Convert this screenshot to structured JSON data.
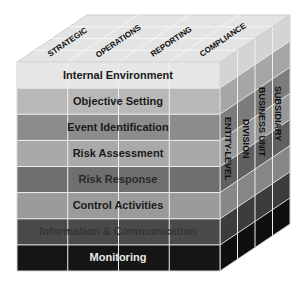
{
  "diagram": {
    "type": "coso-erm-cube",
    "top_face": {
      "objectives": [
        {
          "label": "STRATEGIC"
        },
        {
          "label": "OPERATIONS"
        },
        {
          "label": "REPORTING"
        },
        {
          "label": "COMPLIANCE"
        }
      ]
    },
    "front_face": {
      "components": [
        {
          "label": "Internal Environment",
          "fill": "#e6e6e6",
          "text_color": "#1a1a1a"
        },
        {
          "label": "Objective Setting",
          "fill": "#b8b8b8",
          "text_color": "#1a1a1a"
        },
        {
          "label": "Event Identification",
          "fill": "#8c8c8c",
          "text_color": "#1a1a1a"
        },
        {
          "label": "Risk Assessment",
          "fill": "#a9a9a9",
          "text_color": "#1a1a1a"
        },
        {
          "label": "Risk Response",
          "fill": "#6f6f6f",
          "text_color": "#2a2a2a"
        },
        {
          "label": "Control Activities",
          "fill": "#9a9a9a",
          "text_color": "#1a1a1a"
        },
        {
          "label": "Information & Communication",
          "fill": "#4a4a4a",
          "text_color": "#3a3a3a"
        },
        {
          "label": "Monitoring",
          "fill": "#151515",
          "text_color": "#e8e8e8"
        }
      ]
    },
    "side_face": {
      "units": [
        {
          "label": "ENTITY-LEVEL"
        },
        {
          "label": "DIVISION"
        },
        {
          "label": "BUSINESS UNIT"
        },
        {
          "label": "SUBSIDIARY"
        }
      ]
    },
    "colors": {
      "grid_line": "#f2f2f2",
      "top_fill": "#e4e4e4",
      "background": "#ffffff"
    }
  }
}
